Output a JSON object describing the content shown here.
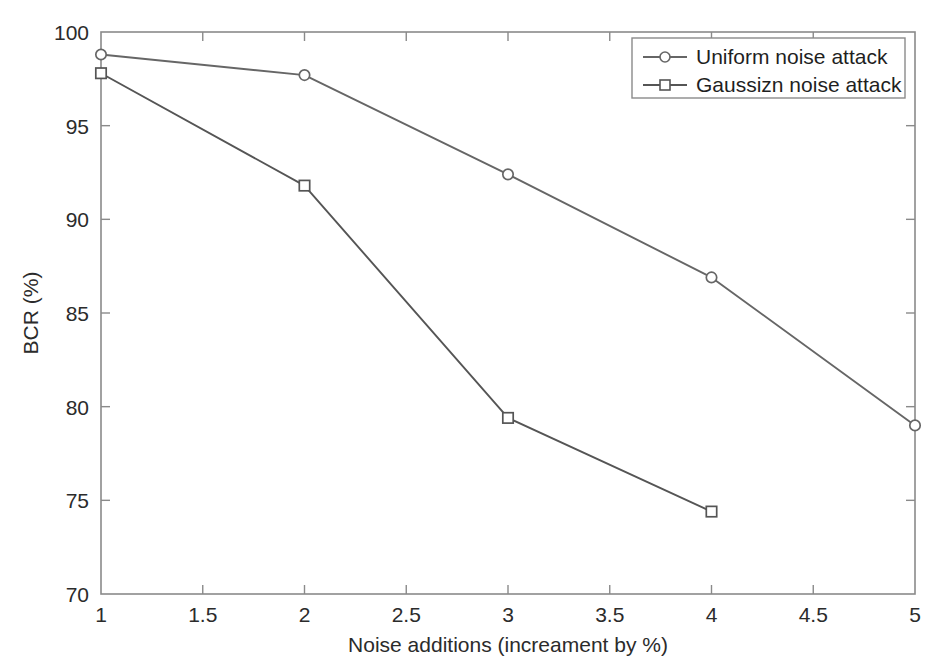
{
  "chart_data": {
    "type": "line",
    "title": "",
    "subtitle": "",
    "xlabel": "Noise additions (increament by %)",
    "ylabel": "BCR (%)",
    "xlim": [
      1,
      5
    ],
    "ylim": [
      70,
      100
    ],
    "xticks": [
      "1",
      "1.5",
      "2",
      "2.5",
      "3",
      "3.5",
      "4",
      "4.5",
      "5"
    ],
    "xtick_values": [
      1,
      1.5,
      2,
      2.5,
      3,
      3.5,
      4,
      4.5,
      5
    ],
    "yticks": [
      "70",
      "75",
      "80",
      "85",
      "90",
      "95",
      "100"
    ],
    "ytick_values": [
      70,
      75,
      80,
      85,
      90,
      95,
      100
    ],
    "grid": false,
    "legend_position": "top-right",
    "series": [
      {
        "name": "Uniform noise attack",
        "marker": "circle",
        "color": "#666666",
        "x": [
          1,
          2,
          3,
          4,
          5
        ],
        "values": [
          98.8,
          97.7,
          92.4,
          86.9,
          79.0
        ]
      },
      {
        "name": "Gaussizn noise attack",
        "marker": "square",
        "color": "#555555",
        "x": [
          1,
          2,
          3,
          4
        ],
        "values": [
          97.8,
          91.8,
          79.4,
          74.4
        ]
      }
    ]
  },
  "legend": {
    "entries": [
      {
        "label": "Uniform noise attack",
        "marker": "circle-marker"
      },
      {
        "label": "Gaussizn noise attack",
        "marker": "square-marker"
      }
    ]
  },
  "colors": {
    "background": "#ffffff",
    "axis": "#8a8a8a",
    "text": "#2b2b2b",
    "series_uniform": "#666666",
    "series_gaussian": "#555555"
  }
}
